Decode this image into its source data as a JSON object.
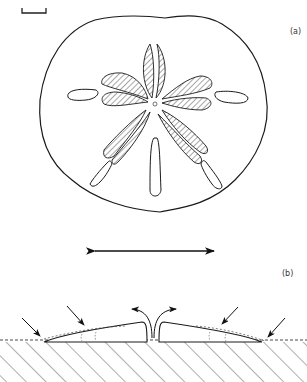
{
  "figure": {
    "panel_a": {
      "label": "(a)",
      "subject": "sand dollar, aboral view",
      "parts": [
        "test outline",
        "petaloid ambulacra x5",
        "distal ambulacral slits x5",
        "central apical system",
        "scale bar"
      ]
    },
    "panel_b": {
      "label": "(b)",
      "subject": "sand dollar cross-section on sediment",
      "parts": [
        "test profile (left half)",
        "test profile (right half)",
        "central exhalant flow arrows",
        "inhalant flow arrows x4",
        "sediment surface (dashed)",
        "hatched sediment"
      ]
    },
    "double_arrow": "horizontal double-headed arrow between panels"
  },
  "colors": {
    "ink": "#1a1a1a",
    "background": "#ffffff"
  }
}
